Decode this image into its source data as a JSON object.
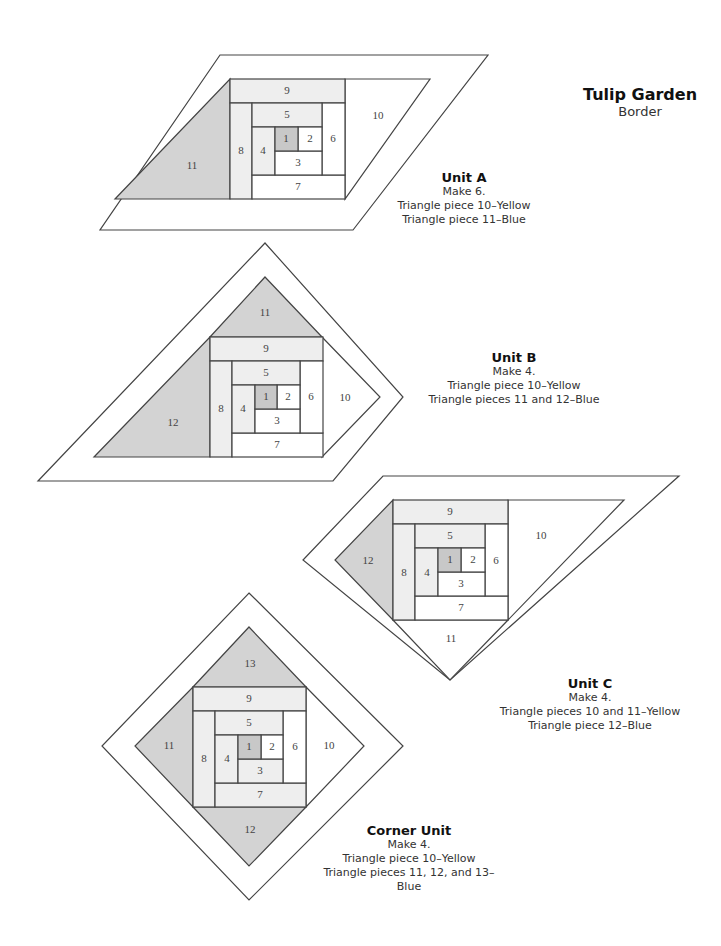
{
  "title": {
    "main": "Tulip Garden",
    "sub": "Border"
  },
  "units": [
    {
      "name": "Unit A",
      "lines": [
        "Make 6.",
        "Triangle piece 10–Yellow",
        "Triangle piece 11–Blue"
      ],
      "pieces": {
        "p1": "1",
        "p2": "2",
        "p3": "3",
        "p4": "4",
        "p5": "5",
        "p6": "6",
        "p7": "7",
        "p8": "8",
        "p9": "9",
        "p10": "10",
        "p11": "11"
      }
    },
    {
      "name": "Unit B",
      "lines": [
        "Make 4.",
        "Triangle piece 10–Yellow",
        "Triangle pieces 11 and 12–Blue"
      ],
      "pieces": {
        "p1": "1",
        "p2": "2",
        "p3": "3",
        "p4": "4",
        "p5": "5",
        "p6": "6",
        "p7": "7",
        "p8": "8",
        "p9": "9",
        "p10": "10",
        "p11": "11",
        "p12": "12"
      }
    },
    {
      "name": "Unit C",
      "lines": [
        "Make 4.",
        "Triangle pieces 10 and 11–Yellow",
        "Triangle piece 12–Blue"
      ],
      "pieces": {
        "p1": "1",
        "p2": "2",
        "p3": "3",
        "p4": "4",
        "p5": "5",
        "p6": "6",
        "p7": "7",
        "p8": "8",
        "p9": "9",
        "p10": "10",
        "p11": "11",
        "p12": "12"
      }
    },
    {
      "name": "Corner Unit",
      "lines": [
        "Make 4.",
        "Triangle piece 10–Yellow",
        "Triangle pieces 11, 12, and 13–Blue"
      ],
      "pieces": {
        "p1": "1",
        "p2": "2",
        "p3": "3",
        "p4": "4",
        "p5": "5",
        "p6": "6",
        "p7": "7",
        "p8": "8",
        "p9": "9",
        "p10": "10",
        "p11": "11",
        "p12": "12",
        "p13": "13"
      }
    }
  ],
  "colors": {
    "blue_fill": "#d3d3d3",
    "light_fill": "#eeeeee",
    "center_fill": "#c8c8c8",
    "line": "#444444"
  }
}
